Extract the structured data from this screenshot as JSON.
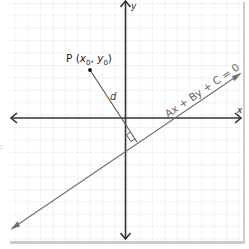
{
  "diagram": {
    "axes": {
      "x_label": "x",
      "y_label": "y"
    },
    "point": {
      "name": "P",
      "label_prefix": "P (",
      "x_sym": "x",
      "x_sub": "0",
      "sep": ", ",
      "y_sym": "y",
      "y_sub": "0",
      "label_suffix": ")"
    },
    "distance_label": "d",
    "line_equation": "Ax + By + C = 0",
    "margin_mark": ":",
    "colors": {
      "background": "#ffffff",
      "grid": "#e6e6e6",
      "axis": "#333333",
      "line": "#6e6e6e",
      "text": "#222222",
      "equation_text": "#666666",
      "panel_shadow": "#c8c8c8"
    }
  }
}
